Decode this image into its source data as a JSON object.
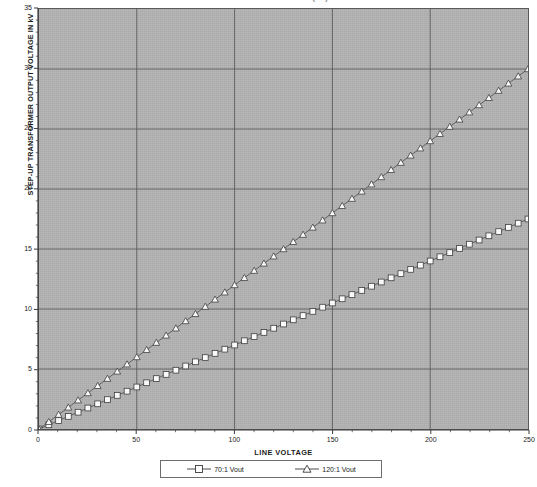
{
  "title_sliver": "TRANSFORMER OUTPUT (kV)",
  "axes": {
    "y_title": "STEP-UP TRANSFORMER OUTPUT VOLTAGE IN kV",
    "x_title": "LINE VOLTAGE",
    "y_ticks": [
      "0",
      "5",
      "10",
      "15",
      "20",
      "25",
      "30",
      "35"
    ],
    "x_ticks": [
      "0",
      "50",
      "100",
      "150",
      "200",
      "250"
    ]
  },
  "legend": {
    "entries": [
      {
        "label": "70:1 Vout",
        "marker": "square-marker",
        "color": "#4a4a4a"
      },
      {
        "label": "120:1 Vout",
        "marker": "triangle-marker",
        "color": "#4a4a4a"
      }
    ]
  },
  "colors": {
    "plot_background": "#b2b2b2",
    "page_background": "#ffffff",
    "gridline": "#4f4f4f",
    "axis": "#3a3a3a",
    "series_line": "#5c5c5c",
    "marker_fill": "#ffffff",
    "marker_stroke": "#3a3a3a",
    "text": "#1b1b1b"
  },
  "chart_data": {
    "type": "line",
    "xlabel": "LINE VOLTAGE",
    "ylabel": "STEP-UP TRANSFORMER OUTPUT VOLTAGE IN kV",
    "xlim": [
      0,
      250
    ],
    "ylim": [
      0,
      35
    ],
    "x_major_tick": 50,
    "x_minor_tick": 10,
    "y_major_tick": 5,
    "y_minor_tick": 1,
    "grid": true,
    "legend_position": "bottom",
    "x": [
      0,
      5,
      10,
      15,
      20,
      25,
      30,
      35,
      40,
      45,
      50,
      55,
      60,
      65,
      70,
      75,
      80,
      85,
      90,
      95,
      100,
      105,
      110,
      115,
      120,
      125,
      130,
      135,
      140,
      145,
      150,
      155,
      160,
      165,
      170,
      175,
      180,
      185,
      190,
      195,
      200,
      205,
      210,
      215,
      220,
      225,
      230,
      235,
      240,
      245,
      250
    ],
    "series": [
      {
        "name": "70:1 Vout",
        "marker": "square",
        "values": [
          0.0,
          0.35,
          0.7,
          1.05,
          1.4,
          1.75,
          2.1,
          2.45,
          2.8,
          3.15,
          3.5,
          3.85,
          4.2,
          4.55,
          4.9,
          5.25,
          5.6,
          5.95,
          6.3,
          6.65,
          7.0,
          7.35,
          7.7,
          8.05,
          8.4,
          8.75,
          9.1,
          9.45,
          9.8,
          10.15,
          10.5,
          10.85,
          11.2,
          11.55,
          11.9,
          12.25,
          12.6,
          12.95,
          13.3,
          13.65,
          14.0,
          14.35,
          14.7,
          15.05,
          15.4,
          15.75,
          16.1,
          16.45,
          16.8,
          17.15,
          17.5
        ]
      },
      {
        "name": "120:1 Vout",
        "marker": "triangle",
        "values": [
          0.0,
          0.6,
          1.2,
          1.8,
          2.4,
          3.0,
          3.6,
          4.2,
          4.8,
          5.4,
          6.0,
          6.6,
          7.2,
          7.8,
          8.4,
          9.0,
          9.6,
          10.2,
          10.8,
          11.4,
          12.0,
          12.6,
          13.2,
          13.8,
          14.4,
          15.0,
          15.6,
          16.2,
          16.8,
          17.4,
          18.0,
          18.6,
          19.2,
          19.8,
          20.4,
          21.0,
          21.6,
          22.2,
          22.8,
          23.4,
          24.0,
          24.6,
          25.2,
          25.8,
          26.4,
          27.0,
          27.6,
          28.2,
          28.8,
          29.4,
          30.0
        ]
      }
    ]
  }
}
